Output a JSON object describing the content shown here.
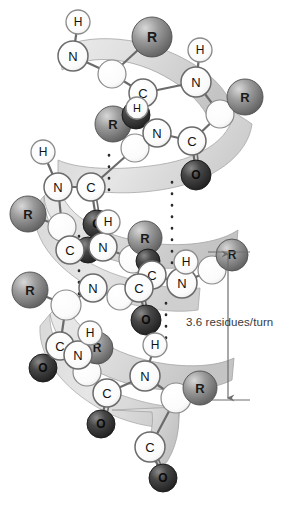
{
  "figure": {
    "background_color": "#ffffff",
    "annotation": {
      "label": "3.6 residues/turn",
      "text_color": "#3a3a3a",
      "arrow_color": "#6e6e6e",
      "arrow_x": 228,
      "arrow_top_y": 252,
      "arrow_bottom_y": 400,
      "tick_left_x": 208,
      "tick_right_x": 248
    },
    "ribbon": {
      "fill_color": "#dedede",
      "edge_color": "#9a9a9a",
      "shadow_color": "#c2c2c2"
    },
    "bond": {
      "color": "#6b6b6b",
      "hbond_color": "#2b2b2b",
      "hbond_style": "dotted"
    },
    "atom_styles": {
      "R": {
        "label": "R",
        "kind": "sphere",
        "fill": "#8d8d8d",
        "highlight": "#cfcfcf",
        "edge": "#4a4a4a",
        "text_color": "#1a1a1a",
        "radius": 15
      },
      "O": {
        "label": "O",
        "kind": "sphere",
        "fill": "#3c3c3c",
        "highlight": "#7a7a7a",
        "edge": "#1a1a1a",
        "text_color": "#0a0a0a",
        "radius": 13
      },
      "N": {
        "label": "N",
        "kind": "circle",
        "fill": "#fbfbfb",
        "edge": "#6b6b6b",
        "text_color": "#111111",
        "radius": 13
      },
      "C": {
        "label": "C",
        "kind": "circle",
        "fill": "#fbfbfb",
        "edge": "#6b6b6b",
        "text_color": "#111111",
        "radius": 13
      },
      "H": {
        "label": "H",
        "kind": "circle",
        "fill": "#fdfdfd",
        "edge": "#8a8a8a",
        "text_color": "#111111",
        "radius": 11
      },
      "CA": {
        "label": "",
        "kind": "circle",
        "fill": "#f4f4f4",
        "edge": "#8a8a8a",
        "text_color": "#111111",
        "radius": 14
      }
    },
    "atoms": [
      {
        "id": "h1",
        "type": "H",
        "x": 78,
        "y": 22
      },
      {
        "id": "n1",
        "type": "N",
        "x": 73,
        "y": 56
      },
      {
        "id": "r1",
        "type": "R",
        "x": 152,
        "y": 37
      },
      {
        "id": "ca1",
        "type": "CA",
        "x": 112,
        "y": 74
      },
      {
        "id": "c1",
        "type": "C",
        "x": 143,
        "y": 93
      },
      {
        "id": "h2",
        "type": "H",
        "x": 200,
        "y": 50
      },
      {
        "id": "n2",
        "type": "N",
        "x": 196,
        "y": 82
      },
      {
        "id": "r2",
        "type": "R",
        "x": 245,
        "y": 97
      },
      {
        "id": "ca2",
        "type": "CA",
        "x": 220,
        "y": 114
      },
      {
        "id": "o1",
        "type": "O",
        "x": 136,
        "y": 115
      },
      {
        "id": "h3",
        "type": "H",
        "x": 137,
        "y": 108
      },
      {
        "id": "r3",
        "type": "R",
        "x": 113,
        "y": 124
      },
      {
        "id": "n3",
        "type": "N",
        "x": 157,
        "y": 133
      },
      {
        "id": "c2",
        "type": "C",
        "x": 192,
        "y": 141
      },
      {
        "id": "ca3",
        "type": "CA",
        "x": 135,
        "y": 148
      },
      {
        "id": "h4",
        "type": "H",
        "x": 43,
        "y": 152
      },
      {
        "id": "n4",
        "type": "N",
        "x": 58,
        "y": 187
      },
      {
        "id": "c3",
        "type": "C",
        "x": 91,
        "y": 187
      },
      {
        "id": "o2",
        "type": "O",
        "x": 196,
        "y": 175
      },
      {
        "id": "r4",
        "type": "R",
        "x": 28,
        "y": 214
      },
      {
        "id": "ca4",
        "type": "CA",
        "x": 62,
        "y": 227
      },
      {
        "id": "o3",
        "type": "O",
        "x": 97,
        "y": 224
      },
      {
        "id": "c4",
        "type": "C",
        "x": 70,
        "y": 250
      },
      {
        "id": "h5",
        "type": "H",
        "x": 108,
        "y": 222
      },
      {
        "id": "n5",
        "type": "N",
        "x": 103,
        "y": 247
      },
      {
        "id": "r5",
        "type": "R",
        "x": 145,
        "y": 238
      },
      {
        "id": "ca5",
        "type": "CA",
        "x": 133,
        "y": 259
      },
      {
        "id": "o4",
        "type": "O",
        "x": 88,
        "y": 250
      },
      {
        "id": "h6",
        "type": "H",
        "x": 186,
        "y": 262
      },
      {
        "id": "n6",
        "type": "N",
        "x": 182,
        "y": 283
      },
      {
        "id": "c5",
        "type": "C",
        "x": 152,
        "y": 275
      },
      {
        "id": "r6",
        "type": "R",
        "x": 232,
        "y": 255
      },
      {
        "id": "o5",
        "type": "O",
        "x": 148,
        "y": 261
      },
      {
        "id": "h7",
        "type": "H",
        "x": 94,
        "y": 287
      },
      {
        "id": "n7",
        "type": "N",
        "x": 93,
        "y": 288
      },
      {
        "id": "r7",
        "type": "R",
        "x": 30,
        "y": 290
      },
      {
        "id": "ca6",
        "type": "CA",
        "x": 66,
        "y": 305
      },
      {
        "id": "c6",
        "type": "C",
        "x": 139,
        "y": 288
      },
      {
        "id": "o6",
        "type": "O",
        "x": 146,
        "y": 320
      },
      {
        "id": "h8",
        "type": "H",
        "x": 89,
        "y": 343
      },
      {
        "id": "c7",
        "type": "C",
        "x": 60,
        "y": 346
      },
      {
        "id": "n8",
        "type": "N",
        "x": 75,
        "y": 355
      },
      {
        "id": "r8",
        "type": "R",
        "x": 97,
        "y": 348
      },
      {
        "id": "o7",
        "type": "O",
        "x": 43,
        "y": 368
      },
      {
        "id": "ca7",
        "type": "CA",
        "x": 87,
        "y": 372
      },
      {
        "id": "c8",
        "type": "C",
        "x": 107,
        "y": 393
      },
      {
        "id": "h9",
        "type": "H",
        "x": 155,
        "y": 345
      },
      {
        "id": "n9",
        "type": "N",
        "x": 145,
        "y": 376
      },
      {
        "id": "ca8",
        "type": "CA",
        "x": 176,
        "y": 398
      },
      {
        "id": "r9",
        "type": "R",
        "x": 200,
        "y": 388
      },
      {
        "id": "o8",
        "type": "O",
        "x": 101,
        "y": 424
      },
      {
        "id": "c9",
        "type": "C",
        "x": 150,
        "y": 447
      },
      {
        "id": "o9",
        "type": "O",
        "x": 163,
        "y": 478
      }
    ],
    "hbond_columns": [
      {
        "x": 172,
        "y_start": 182,
        "y_end": 268,
        "dots": 7
      },
      {
        "x": 109,
        "y_start": 155,
        "y_end": 200,
        "dots": 4
      },
      {
        "x": 79,
        "y_start": 236,
        "y_end": 316,
        "dots": 7
      },
      {
        "x": 166,
        "y_start": 303,
        "y_end": 340,
        "dots": 3
      }
    ]
  }
}
